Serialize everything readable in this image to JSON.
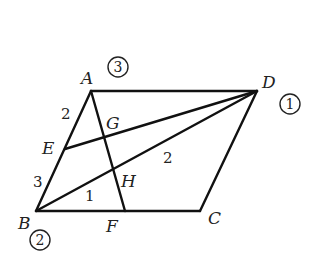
{
  "diagram": {
    "type": "geometry",
    "points": {
      "A": "A",
      "B": "B",
      "C": "C",
      "D": "D",
      "E": "E",
      "F": "F",
      "G": "G",
      "H": "H"
    },
    "segments": [
      "AD",
      "AB",
      "BC",
      "CD",
      "AF",
      "DE",
      "DB"
    ],
    "length_labels": {
      "AE": "2",
      "EB": "3",
      "BH_part": "1",
      "HD_part": "2"
    },
    "circled_labels": {
      "near_A": "3",
      "near_D": "1",
      "near_B": "2"
    },
    "colors": {
      "stroke": "#111111",
      "text": "#222222",
      "background": "#ffffff"
    }
  }
}
